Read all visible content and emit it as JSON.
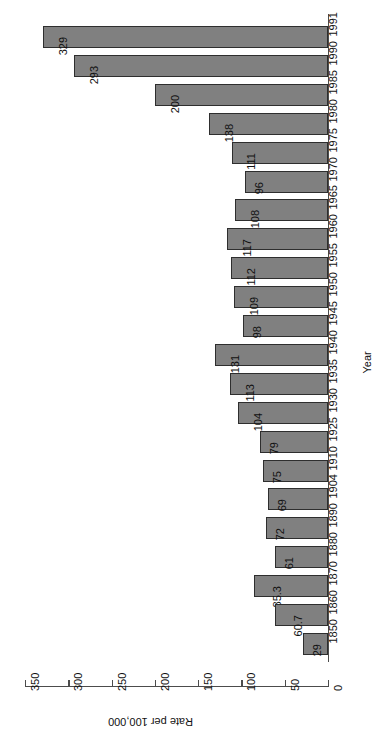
{
  "chart_data": {
    "type": "bar",
    "orientation": "horizontal-rotated",
    "title": "",
    "subtitle": "",
    "xlabel": "Rate per 100,000",
    "ylabel": "Year",
    "xlim": [
      0,
      350
    ],
    "xticks": [
      0,
      50,
      100,
      150,
      200,
      250,
      300,
      350
    ],
    "xtick_labels": [
      "0",
      "50",
      "100",
      "150",
      "200",
      "250",
      "300",
      "350"
    ],
    "grid": false,
    "legend": null,
    "legend_position": "none",
    "bar_fill_color": "#808080",
    "bar_edge_color": "#2e2e2e",
    "axis_color": "#4c4c4c",
    "categories": [
      "1991",
      "1990",
      "1985",
      "1980",
      "1975",
      "1970",
      "1965",
      "1960",
      "1955",
      "1950",
      "1945",
      "1940",
      "1935",
      "1930",
      "1925",
      "1910",
      "1904",
      "1890",
      "1880",
      "1870",
      "1860",
      "1850"
    ],
    "values": [
      329,
      293,
      200,
      138,
      111,
      96,
      108,
      117,
      112,
      109,
      98,
      131,
      113,
      104,
      79,
      75,
      69,
      72,
      61,
      85.3,
      60.7,
      29
    ],
    "value_labels": [
      "329",
      "293",
      "200",
      "138",
      "111",
      "96",
      "108",
      "117",
      "112",
      "109",
      "98",
      "131",
      "113",
      "104",
      "79",
      "75",
      "69",
      "72",
      "61",
      "85.3",
      "60.7",
      "29"
    ]
  }
}
